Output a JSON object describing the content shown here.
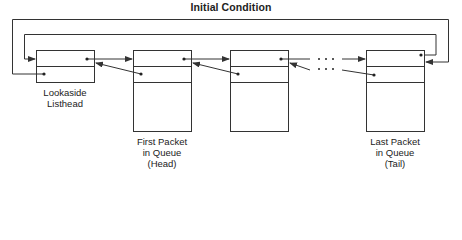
{
  "title": "Initial Condition",
  "nodes": [
    {
      "id": "lookaside",
      "label_lines": [
        "Lookaside",
        "Listhead"
      ]
    },
    {
      "id": "first",
      "label_lines": [
        "First Packet",
        "in Queue",
        "(Head)"
      ]
    },
    {
      "id": "middle",
      "label_lines": []
    },
    {
      "id": "last",
      "label_lines": [
        "Last Packet",
        "in Queue",
        "(Tail)"
      ]
    }
  ],
  "ellipsis": "· · ·",
  "colors": {
    "line": "#333333",
    "background": "#ffffff"
  }
}
